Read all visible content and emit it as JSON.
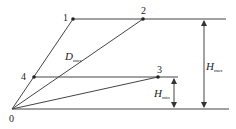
{
  "diagram": {
    "points": [
      {
        "id": "0",
        "label": "0",
        "x": 12,
        "y": 109
      },
      {
        "id": "1",
        "label": "1",
        "x": 73,
        "y": 19
      },
      {
        "id": "2",
        "label": "2",
        "x": 143,
        "y": 19
      },
      {
        "id": "3",
        "label": "3",
        "x": 158,
        "y": 77
      },
      {
        "id": "4",
        "label": "4",
        "x": 34,
        "y": 77
      }
    ],
    "labels": {
      "d_max_main": "D",
      "d_max_sub": "max",
      "h_max_main": "H",
      "h_max_sub": "max",
      "h_min_main": "H",
      "h_min_sub": "min"
    },
    "colors": {
      "line": "#333333",
      "text": "#222222"
    }
  }
}
